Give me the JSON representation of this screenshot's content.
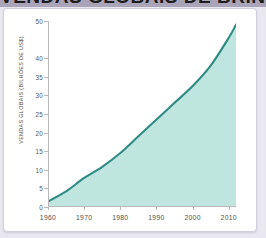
{
  "banner": {
    "title": "VENDAS GLOBAIS DE BRINQUEDOS",
    "background_color": "#a9a4b8"
  },
  "card": {
    "background_color": "#ffffff",
    "border_color": "#d2cedd"
  },
  "chart_data": {
    "type": "area",
    "title": "",
    "xlabel": "",
    "ylabel": "VENDAS GLOBAIS (BILHÕES DE US$)",
    "xlim": [
      1960,
      2012
    ],
    "ylim": [
      0,
      50
    ],
    "grid": false,
    "legend": "none",
    "line_color": "#2e8b83",
    "fill_color": "#bfe6de",
    "xticks": [
      1960,
      1970,
      1980,
      1990,
      2000,
      2010
    ],
    "xtick_labels": [
      "1960",
      "1970",
      "1980",
      "1990",
      "2000",
      "2010"
    ],
    "yticks": [
      0,
      5,
      10,
      15,
      20,
      25,
      30,
      35,
      40,
      50
    ],
    "ytick_labels": [
      "0",
      "5",
      "10",
      "15",
      "20",
      "25",
      "30",
      "35",
      "40",
      "50"
    ],
    "x": [
      1960,
      1965,
      1970,
      1975,
      1980,
      1985,
      1990,
      1995,
      2000,
      2005,
      2010,
      2012
    ],
    "values": [
      1.5,
      4.2,
      7.8,
      10.8,
      14.5,
      19.0,
      23.5,
      28.0,
      32.5,
      38.0,
      45.5,
      49.0
    ]
  }
}
